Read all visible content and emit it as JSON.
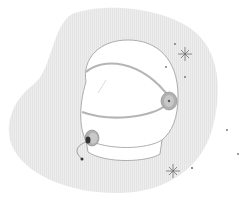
{
  "illustration": {
    "subject": "astronaut-helmet",
    "colors": {
      "background": "#ffffff",
      "blob": "#ececec",
      "helmet_fill": "#ffffff",
      "outline": "#9a9a9a",
      "band": "#b8b8b8",
      "ear_piece": "#a8a8a8",
      "ear_dot": "#555555",
      "star": "#6e6e6e"
    },
    "elements": {
      "blob": "blob-background",
      "helmet": "helmet",
      "visor_band": "visor-band",
      "right_earpiece": "earpiece-right",
      "left_earpiece": "earpiece-left",
      "microphone": "microphone-wire",
      "stars": [
        "sparkle-star-top",
        "sparkle-star-bottom"
      ],
      "dots": 6
    }
  }
}
